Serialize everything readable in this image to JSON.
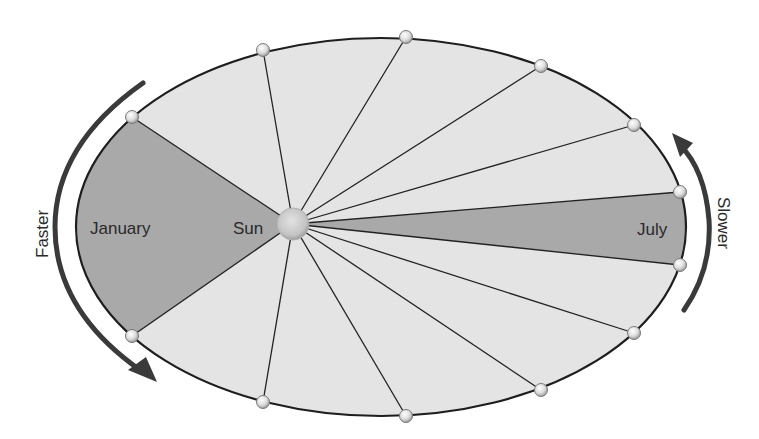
{
  "diagram": {
    "labels": {
      "january": "January",
      "sun": "Sun",
      "july": "July",
      "faster": "Faster",
      "slower": "Slower"
    },
    "colors": {
      "orbit_fill": "#e4e4e4",
      "highlight_fill": "#a9a9a9",
      "line": "#222222",
      "arrow": "#3a3a3a",
      "sun": "#c9c9c9"
    },
    "orbit": {
      "cx": 381,
      "cy": 227,
      "rx": 305,
      "ry": 189
    },
    "sun": {
      "x": 293,
      "y": 224,
      "r": 16
    },
    "planet_positions": [
      {
        "x": 132,
        "y": 117
      },
      {
        "x": 263,
        "y": 50
      },
      {
        "x": 406,
        "y": 37
      },
      {
        "x": 541,
        "y": 66
      },
      {
        "x": 634,
        "y": 125
      },
      {
        "x": 680,
        "y": 192
      },
      {
        "x": 680,
        "y": 265
      },
      {
        "x": 634,
        "y": 333
      },
      {
        "x": 541,
        "y": 390
      },
      {
        "x": 406,
        "y": 416
      },
      {
        "x": 263,
        "y": 402
      },
      {
        "x": 132,
        "y": 336
      }
    ],
    "highlighted_sectors": [
      {
        "name": "January",
        "from": 11,
        "to": 0,
        "side": "left"
      },
      {
        "name": "July",
        "from": 5,
        "to": 6,
        "side": "right"
      }
    ]
  }
}
